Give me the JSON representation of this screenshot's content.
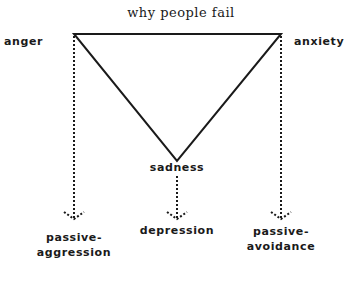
{
  "title": "why people fail",
  "nodes": {
    "anger": "anger",
    "anxiety": "anxiety",
    "sadness": "sadness"
  },
  "outcomes": {
    "left_line1": "passive-",
    "left_line2": "aggression",
    "center": "depression",
    "right_line1": "passive-",
    "right_line2": "avoidance"
  }
}
